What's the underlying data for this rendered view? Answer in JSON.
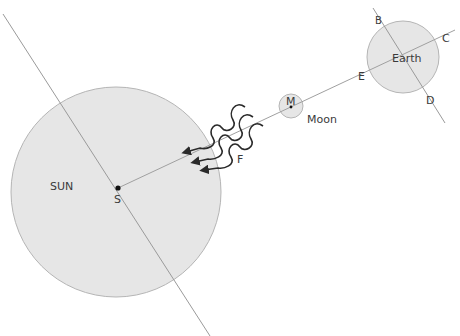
{
  "diagram": {
    "colors": {
      "body_fill": "#e6e6e6",
      "body_stroke": "#b5b5b5",
      "line": "#9a9a9a",
      "text": "#3a3a3a",
      "arrow": "#2a2a2a",
      "point": "#111111"
    },
    "bodies": {
      "sun": {
        "label": "SUN",
        "point_label": "S",
        "cx": 116,
        "cy": 192,
        "r": 105
      },
      "moon": {
        "label": "Moon",
        "point_label": "M",
        "cx": 291,
        "cy": 106,
        "r": 12
      },
      "earth": {
        "label": "Earth",
        "cx": 403,
        "cy": 57,
        "r": 36
      }
    },
    "points": {
      "B": "B",
      "C": "C",
      "D": "D",
      "E": "E",
      "F": "F"
    },
    "lines": [
      {
        "name": "sun-axis",
        "x1": 3,
        "y1": 14,
        "x2": 210,
        "y2": 336
      },
      {
        "name": "sun-earth-line",
        "x1": 118,
        "y1": 188,
        "x2": 455,
        "y2": 30
      },
      {
        "name": "earth-axis",
        "x1": 373,
        "y1": 8,
        "x2": 445,
        "y2": 123
      }
    ],
    "rays_count": 3
  }
}
